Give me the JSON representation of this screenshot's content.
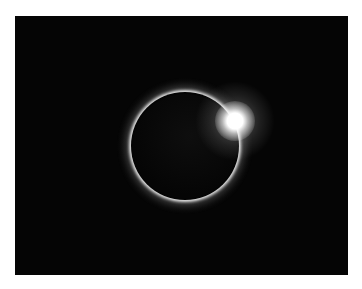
{
  "image": {
    "subject": "total solar eclipse - diamond ring effect",
    "alt": "Solar eclipse with bright diamond ring flare at upper right of the moon's disk",
    "colors": {
      "background": "#050505",
      "border": "#ffffff",
      "corona": "#ffffff"
    }
  }
}
